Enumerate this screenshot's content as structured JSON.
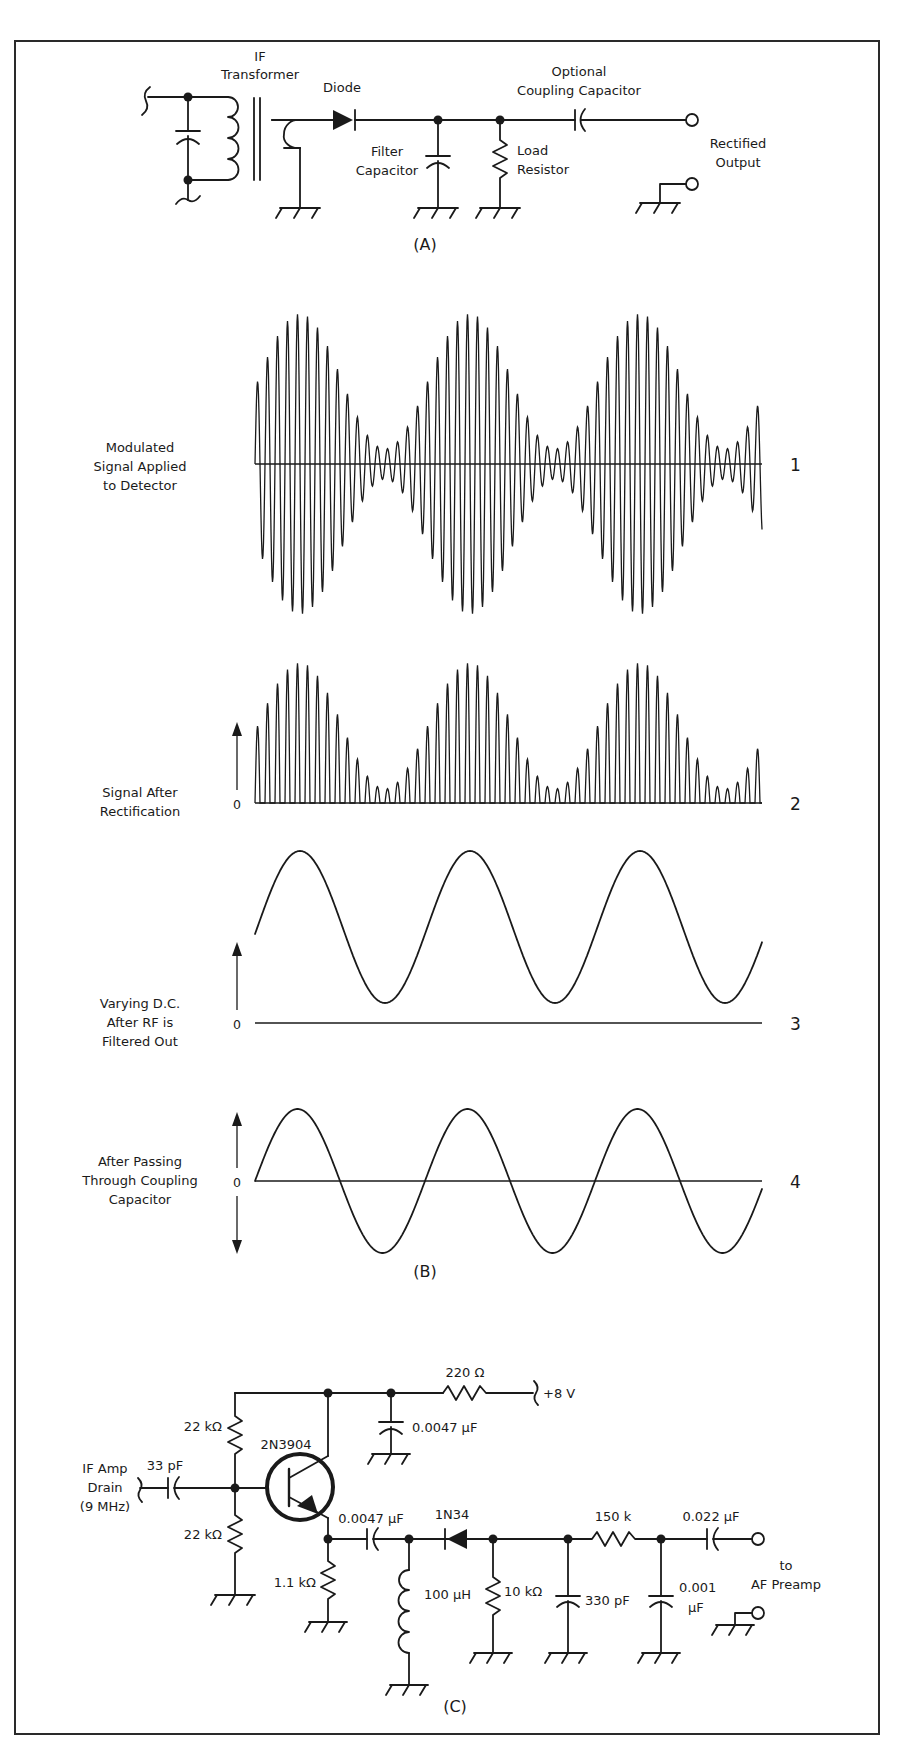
{
  "figure": {
    "panels": [
      "(A)",
      "(B)",
      "(C)"
    ],
    "colors": {
      "ink": "#1a1a1a",
      "background": "#ffffff",
      "frame": "#2a2a2a"
    }
  },
  "panel_a": {
    "part_label": "(A)",
    "if_transformer": [
      "IF",
      "Transformer"
    ],
    "diode": "Diode",
    "filter_capacitor": [
      "Filter",
      "Capacitor"
    ],
    "load_resistor": [
      "Load",
      "Resistor"
    ],
    "coupling_capacitor": [
      "Optional",
      "Coupling Capacitor"
    ],
    "rectified_output": [
      "Rectified",
      "Output"
    ]
  },
  "panel_b": {
    "part_label": "(B)",
    "traces": [
      {
        "number": "1",
        "label": [
          "Modulated",
          "Signal Applied",
          "to Detector"
        ],
        "zero": ""
      },
      {
        "number": "2",
        "label": [
          "Signal After",
          "Rectification"
        ],
        "zero": "0"
      },
      {
        "number": "3",
        "label": [
          "Varying D.C.",
          "After RF is",
          "Filtered Out"
        ],
        "zero": "0"
      },
      {
        "number": "4",
        "label": [
          "After Passing",
          "Through Coupling",
          "Capacitor"
        ],
        "zero": "0"
      }
    ]
  },
  "panel_c": {
    "part_label": "(C)",
    "input_label": [
      "IF Amp",
      "Drain",
      "(9 MHz)"
    ],
    "c_in": "33 pF",
    "r_bias_top": "22 kΩ",
    "r_bias_bottom": "22 kΩ",
    "transistor": "2N3904",
    "r_supply": "220 Ω",
    "supply": "+8 V",
    "c_bypass": "0.0047 µF",
    "r_emitter": "1.1 kΩ",
    "c_couple": "0.0047 µF",
    "inductor": "100 µH",
    "diode": "1N34",
    "r_load": "10 kΩ",
    "c_filter1": "330 pF",
    "r_series": "150 k",
    "c_filter2": [
      "0.001",
      "µF"
    ],
    "c_out": "0.022 µF",
    "output_label": [
      "to",
      "AF Preamp"
    ]
  },
  "chart_data": {
    "type": "line",
    "xlabel": "",
    "ylabel": "",
    "grid": false,
    "series": [
      {
        "name": "1 Modulated Signal Applied to Detector",
        "kind": "AM carrier, ~3 envelope cycles, carrier ≈17 cycles per envelope, modulation ≈90%"
      },
      {
        "name": "2 Signal After Rectification",
        "kind": "half-wave rectified AM (positive half only), baseline 0"
      },
      {
        "name": "3 Varying D.C. After RF is Filtered Out",
        "kind": "sine envelope riding above 0, ~2.8 cycles"
      },
      {
        "name": "4 After Passing Through Coupling Capacitor",
        "kind": "sine centered on 0, ~2.8 cycles"
      }
    ]
  }
}
